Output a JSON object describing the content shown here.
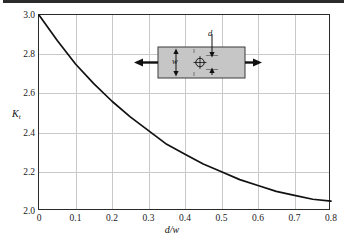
{
  "figure": {
    "background_color": "#ffffff",
    "axis_color": "#2a2a2a",
    "grid_color": "#c9c9c9",
    "curve_color": "#111111",
    "inset_fill_color": "#c6c6c6"
  },
  "axes": {
    "y_label_main": "K",
    "y_label_sub": "t",
    "x_label": "d/w",
    "y_ticks": [
      "3.0",
      "2.8",
      "2.6",
      "2.4",
      "2.2",
      "2.0"
    ],
    "x_ticks": [
      "0",
      "0.1",
      "0.2",
      "0.3",
      "0.4",
      "0.5",
      "0.6",
      "0.7",
      "0.8"
    ]
  },
  "inset": {
    "name": "flat-plate-with-central-hole-in-tension",
    "width_label": "w",
    "diameter_label": "d",
    "left_arrow": "tension-arrow-left",
    "right_arrow": "tension-arrow-right",
    "hole_symbol": "center-crosshair-circle"
  },
  "chart_data": {
    "type": "line",
    "title": "",
    "xlabel": "d/w",
    "ylabel": "Kt",
    "xlim": [
      0,
      0.8
    ],
    "ylim": [
      2.0,
      3.0
    ],
    "xticks": [
      0,
      0.1,
      0.2,
      0.3,
      0.4,
      0.5,
      0.6,
      0.7,
      0.8
    ],
    "yticks": [
      2.0,
      2.2,
      2.4,
      2.6,
      2.8,
      3.0
    ],
    "grid": true,
    "legend": "none",
    "series": [
      {
        "name": "Kt for flat plate with central hole in tension",
        "x": [
          0.0,
          0.05,
          0.1,
          0.15,
          0.2,
          0.25,
          0.3,
          0.35,
          0.4,
          0.45,
          0.5,
          0.55,
          0.6,
          0.65,
          0.7,
          0.75,
          0.8
        ],
        "y": [
          3.0,
          2.87,
          2.75,
          2.65,
          2.56,
          2.48,
          2.41,
          2.34,
          2.29,
          2.24,
          2.2,
          2.16,
          2.13,
          2.1,
          2.08,
          2.06,
          2.05
        ]
      }
    ]
  }
}
